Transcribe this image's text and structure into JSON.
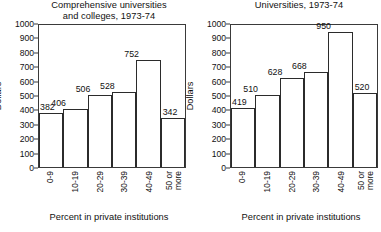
{
  "chart_data": [
    {
      "type": "bar",
      "title": "Comprehensive universities and colleges, 1973-74",
      "title_lines": [
        "Comprehensive universities",
        "and colleges, 1973-74"
      ],
      "xlabel": "Percent in private institutions",
      "ylabel": "Dollars",
      "categories": [
        "0-9",
        "10-19",
        "20-29",
        "30-39",
        "40-49",
        "50 or more"
      ],
      "category_lines": [
        [
          "0-9"
        ],
        [
          "10-19"
        ],
        [
          "20-29"
        ],
        [
          "30-39"
        ],
        [
          "40-49"
        ],
        [
          "50 or",
          "more"
        ]
      ],
      "values": [
        382,
        406,
        506,
        528,
        752,
        342
      ],
      "ylim": [
        0,
        1000
      ],
      "yticks": [
        1000,
        900,
        800,
        700,
        600,
        500,
        400,
        300,
        200,
        100,
        0
      ],
      "grid": false,
      "legend": false
    },
    {
      "type": "bar",
      "title": "Universities, 1973-74",
      "title_lines": [
        "Universities, 1973-74"
      ],
      "xlabel": "Percent in private institutions",
      "ylabel": "Dollars",
      "categories": [
        "0-9",
        "10-19",
        "20-29",
        "30-39",
        "40-49",
        "50 or more"
      ],
      "category_lines": [
        [
          "0-9"
        ],
        [
          "10-19"
        ],
        [
          "20-29"
        ],
        [
          "30-39"
        ],
        [
          "40-49"
        ],
        [
          "50 or",
          "more"
        ]
      ],
      "values": [
        419,
        510,
        628,
        668,
        950,
        520
      ],
      "ylim": [
        0,
        1000
      ],
      "yticks": [
        1000,
        900,
        800,
        700,
        600,
        500,
        400,
        300,
        200,
        100,
        0
      ],
      "grid": false,
      "legend": false
    }
  ],
  "style": {
    "bar_fill": "#ffffff",
    "bar_stroke": "#2b2b2b",
    "axis_color": "#3a3a3a",
    "text_color": "#111111",
    "background": "#ffffff"
  }
}
